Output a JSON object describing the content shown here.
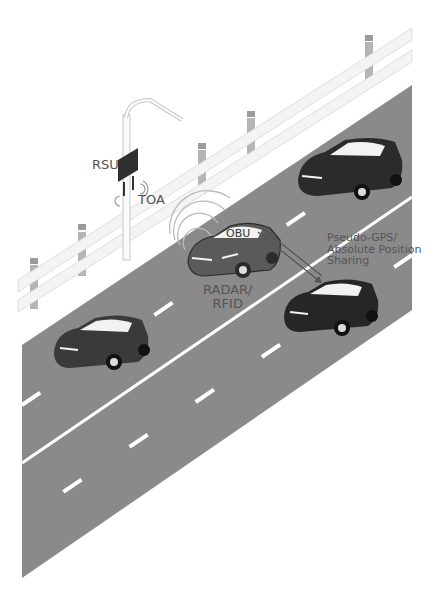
{
  "diagram": {
    "colors": {
      "road": "#8a8a8a",
      "lane_marking": "#ffffff",
      "guardrail": "#f4f4f4",
      "guardrail_edge": "#d8d8d8",
      "post": "#b5b5b5",
      "car_dark": "#2b2b2b",
      "car_mid": "#5a5a5a",
      "label_text": "#555555"
    },
    "labels": {
      "rsu": "RSU",
      "toa": "TOA",
      "obu": "OBU",
      "radar_line1": "RADAR/",
      "radar_line2": "RFID",
      "pseudo_line1": "Pseudo-GPS/",
      "pseudo_line2": "Absolute Position",
      "pseudo_line3": "Sharing"
    },
    "nodes": [
      {
        "id": "rsu",
        "label": "RSU",
        "kind": "road-side-unit on lamp post"
      },
      {
        "id": "car-obu",
        "label": "OBU",
        "kind": "vehicle with on-board unit"
      },
      {
        "id": "car-top-right",
        "kind": "vehicle"
      },
      {
        "id": "car-target",
        "kind": "vehicle"
      },
      {
        "id": "car-bottom-left",
        "kind": "vehicle"
      }
    ],
    "edges": [
      {
        "from": "rsu",
        "to": "car-obu",
        "label": "TOA"
      },
      {
        "from": "car-obu",
        "to": "car-target",
        "label": "Pseudo-GPS/ Absolute Position Sharing"
      },
      {
        "from": "car-obu",
        "to": "surroundings",
        "label": "RADAR/ RFID"
      }
    ]
  }
}
